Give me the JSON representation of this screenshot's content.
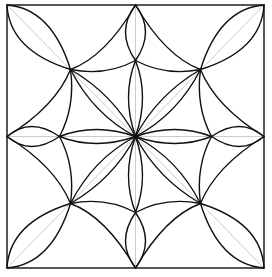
{
  "diagram": {
    "title": "",
    "colors": {
      "stroke": "#111111",
      "guide": "#cccccc",
      "background": "#ffffff"
    },
    "frame": {
      "left": 7,
      "top": 5,
      "right": 264,
      "bottom": 268
    }
  }
}
